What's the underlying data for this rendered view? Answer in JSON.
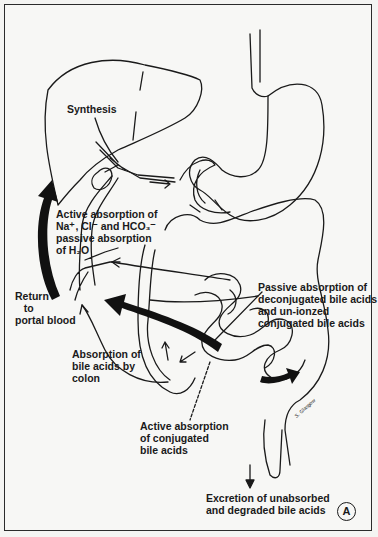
{
  "figure": {
    "panel_label": "A",
    "artist_signature": "S. Glasgow",
    "labels": {
      "synthesis": "Synthesis",
      "active_absorption_ions": "Active absorption of\nNa⁺, Cl⁻ and HCO₃⁻\npassive absorption\nof H₂O",
      "return_portal": "Return\n   to\nportal blood",
      "absorption_colon": "Absorption of\nbile acids by\ncolon",
      "passive_absorption": "Passive absorption of\ndeconjugated bile acids\nand un-ionzed\nconjugated bile acids",
      "active_absorption_conjugated": "Active absorption\nof conjugated\nbile acids",
      "excretion": "Excretion of unabsorbed\nand degraded bile acids"
    },
    "organs": [
      "liver",
      "gallbladder",
      "bile-duct",
      "stomach",
      "esophagus",
      "duodenum",
      "small-intestine",
      "colon",
      "rectum",
      "portal-vein"
    ],
    "colors": {
      "line": "#1a1a1a",
      "background": "#f7f7f5"
    }
  }
}
